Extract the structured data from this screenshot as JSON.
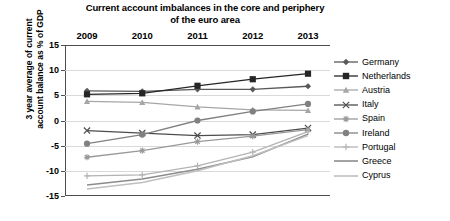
{
  "chart_data": {
    "type": "line",
    "title": "Current account imbalances in the core and periphery of the euro area",
    "title_line1": "Current account imbalances in the core and periphery",
    "title_line2": "of the euro area",
    "xlabel": "",
    "ylabel": "3 year average of current account balance as % of GDP",
    "ylabel_line1": "3 year average of current",
    "ylabel_line2": "account balance as % of GDP",
    "categories": [
      "2009",
      "2010",
      "2011",
      "2012",
      "2013"
    ],
    "x": [
      2009,
      2010,
      2011,
      2012,
      2013
    ],
    "ylim": [
      -15,
      15
    ],
    "ytick_labels": [
      "15",
      "10",
      "5",
      "0",
      "-5",
      "-10",
      "-15"
    ],
    "yticks": [
      15,
      10,
      5,
      0,
      -5,
      -10,
      -15
    ],
    "grid": true,
    "xaxis_position": "top",
    "legend_position": "right",
    "series": [
      {
        "name": "Germany",
        "marker": "diamond",
        "color": "#595959",
        "values": [
          5.9,
          5.8,
          6.2,
          6.2,
          6.8
        ]
      },
      {
        "name": "Netherlands",
        "marker": "square",
        "color": "#262626",
        "values": [
          5.2,
          5.4,
          6.9,
          8.2,
          9.3
        ]
      },
      {
        "name": "Austria",
        "marker": "triangle",
        "color": "#a6a6a6",
        "values": [
          3.8,
          3.6,
          2.7,
          2.1,
          2.0
        ]
      },
      {
        "name": "Italy",
        "marker": "x",
        "color": "#4d4d4d",
        "values": [
          -2.0,
          -2.5,
          -3.0,
          -2.8,
          -1.5
        ]
      },
      {
        "name": "Spain",
        "marker": "asterisk",
        "color": "#999999",
        "values": [
          -7.3,
          -6.0,
          -4.2,
          -3.1,
          -1.8
        ]
      },
      {
        "name": "Ireland",
        "marker": "circle",
        "color": "#808080",
        "values": [
          -4.6,
          -2.8,
          0.0,
          1.8,
          3.3
        ]
      },
      {
        "name": "Portugal",
        "marker": "plus",
        "color": "#b3b3b3",
        "values": [
          -11.0,
          -10.8,
          -9.0,
          -6.3,
          -2.2
        ]
      },
      {
        "name": "Greece",
        "marker": "none",
        "color": "#8c8c8c",
        "values": [
          -12.8,
          -11.6,
          -9.7,
          -7.2,
          -2.7
        ]
      },
      {
        "name": "Cyprus",
        "marker": "none",
        "color": "#bfbfbf",
        "values": [
          -13.6,
          -12.3,
          -10.0,
          -7.0,
          -3.0
        ]
      }
    ]
  }
}
